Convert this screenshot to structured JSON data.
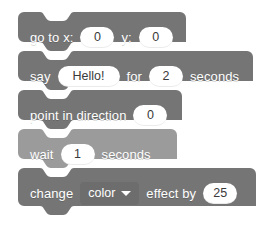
{
  "canvas": {
    "background": "#ffffff",
    "width": 269,
    "height": 238
  },
  "palette": {
    "motion_block": "#757575",
    "looks_block": "#757575",
    "control_block": "#9b9b9b",
    "dropdown": "#6d6d6d",
    "input_field": "#ffffff",
    "label_text": "#ffffff",
    "input_text": "#3a3a3a"
  },
  "script": {
    "name": "scratch-block-stack",
    "blocks": [
      {
        "id": "go-to-xy",
        "opcode": "motion_gotoxy",
        "color": "#757575",
        "parts": [
          {
            "kind": "label",
            "text": "go to x:"
          },
          {
            "kind": "input",
            "name": "x",
            "value": "0"
          },
          {
            "kind": "label",
            "text": "y:"
          },
          {
            "kind": "input",
            "name": "y",
            "value": "0"
          }
        ]
      },
      {
        "id": "say-for-secs",
        "opcode": "looks_sayforsecs",
        "color": "#757575",
        "parts": [
          {
            "kind": "label",
            "text": "say"
          },
          {
            "kind": "input-text",
            "name": "message",
            "value": "Hello!"
          },
          {
            "kind": "label",
            "text": "for"
          },
          {
            "kind": "input",
            "name": "secs",
            "value": "2"
          },
          {
            "kind": "label",
            "text": "seconds"
          }
        ]
      },
      {
        "id": "point-in-direction",
        "opcode": "motion_pointindirection",
        "color": "#757575",
        "parts": [
          {
            "kind": "label",
            "text": "point in direction"
          },
          {
            "kind": "input",
            "name": "direction",
            "value": "0"
          }
        ]
      },
      {
        "id": "wait-secs",
        "opcode": "control_wait",
        "color": "#9b9b9b",
        "parts": [
          {
            "kind": "label",
            "text": "wait"
          },
          {
            "kind": "input",
            "name": "duration",
            "value": "1"
          },
          {
            "kind": "label",
            "text": "seconds"
          }
        ]
      },
      {
        "id": "change-effect-by",
        "opcode": "looks_changeeffectby",
        "color": "#757575",
        "parts": [
          {
            "kind": "label",
            "text": "change"
          },
          {
            "kind": "dropdown",
            "name": "effect",
            "value": "color",
            "icon": "chevron-down-icon"
          },
          {
            "kind": "label",
            "text": "effect by"
          },
          {
            "kind": "input",
            "name": "amount",
            "value": "25"
          }
        ]
      }
    ]
  }
}
